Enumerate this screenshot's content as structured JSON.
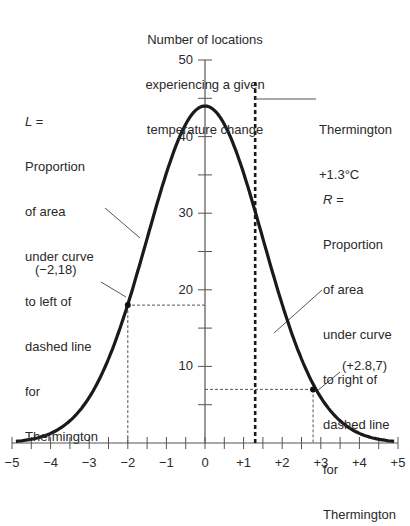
{
  "chart_data": {
    "type": "line",
    "title": "",
    "ylabel": "Number of locations experiencing a given temperature change",
    "ylabel_lines": [
      "Number of locations",
      "experiencing a given",
      "temperature change"
    ],
    "xlabel": "",
    "xlim": [
      -5,
      5
    ],
    "ylim": [
      0,
      50
    ],
    "x_ticks": [
      "−5",
      "−4",
      "−3",
      "−2",
      "−1",
      "0",
      "+1",
      "+2",
      "+3",
      "+4",
      "+5"
    ],
    "x_tick_values": [
      -5,
      -4,
      -3,
      -2,
      -1,
      0,
      1,
      2,
      3,
      4,
      5
    ],
    "y_tick_labels": [
      "10",
      "20",
      "30",
      "40",
      "50"
    ],
    "y_tick_values": [
      10,
      20,
      30,
      40,
      50
    ],
    "grid": false,
    "series": [
      {
        "name": "Distribution of temperature change",
        "x": [
          -5,
          -4.5,
          -4,
          -3.5,
          -3,
          -2.5,
          -2,
          -1.5,
          -1,
          -0.5,
          0,
          0.5,
          1,
          1.3,
          1.5,
          2,
          2.5,
          2.8,
          3,
          3.5,
          4,
          4.5,
          5
        ],
        "y": [
          0.8,
          1.5,
          3.4,
          7.0,
          13.0,
          18.0,
          18,
          26.6,
          35.2,
          41.6,
          44,
          41.6,
          35.2,
          30.4,
          26.6,
          18,
          10.8,
          7,
          5.8,
          2.8,
          1.2,
          0.5,
          0.2
        ]
      }
    ],
    "marked_points": [
      {
        "label": "(−2,18)",
        "x": -2,
        "y": 18
      },
      {
        "label": "(+2.8,7)",
        "x": 2.8,
        "y": 7
      }
    ],
    "vertical_line": {
      "x": 1.3,
      "label": [
        "Thermington",
        "+1.3°C"
      ]
    },
    "annotations": {
      "left": [
        "L =",
        "Proportion",
        "of area",
        "under curve",
        "to left of",
        "dashed line",
        "for",
        "Thermington"
      ],
      "right": [
        "R =",
        "Proportion",
        "of area",
        "under curve",
        "to right of",
        "dashed line",
        "for",
        "Thermington"
      ]
    },
    "curve_params": {
      "peak": 44,
      "sigma": 1.5
    }
  }
}
